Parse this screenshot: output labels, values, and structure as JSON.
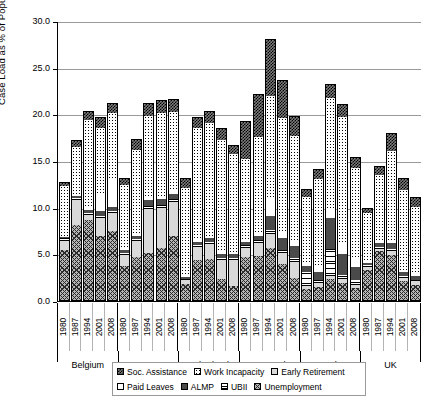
{
  "chart_data": {
    "type": "bar",
    "subtype": "stacked",
    "title": "",
    "xlabel": "",
    "ylabel": "Case Load as % of Population 15-64",
    "ylim": [
      0,
      30
    ],
    "ytick_labels": [
      "0.0",
      "5.0",
      "10.0",
      "15.0",
      "20.0",
      "25.0",
      "30.0"
    ],
    "ytick_values": [
      0,
      5,
      10,
      15,
      20,
      25,
      30
    ],
    "grid": true,
    "legend_position": "bottom",
    "series_names": [
      "Soc. Assistance",
      "Work Incapacity",
      "Early Retirement",
      "Paid Leaves",
      "ALMP",
      "UBII",
      "Unemployment"
    ],
    "groups": [
      "Belgium",
      "Germany",
      "Netherlands",
      "Denmark",
      "Sweden",
      "UK"
    ],
    "categories": [
      "1980",
      "1987",
      "1994",
      "2001",
      "2008"
    ],
    "bars": [
      {
        "group": "Belgium",
        "year": "1980",
        "total": 12.5,
        "segments": {
          "Unemployment": 5.4,
          "Early Retirement": 0.9,
          "UBII": 0.3,
          "ALMP": 0.2,
          "Paid Leaves": 0.1,
          "Work Incapacity": 5.3,
          "Soc. Assistance": 0.3
        }
      },
      {
        "group": "Belgium",
        "year": "1987",
        "total": 17.0,
        "segments": {
          "Unemployment": 8.0,
          "Early Retirement": 2.7,
          "UBII": 0.2,
          "ALMP": 0.3,
          "Paid Leaves": 0.1,
          "Work Incapacity": 5.1,
          "Soc. Assistance": 0.6
        }
      },
      {
        "group": "Belgium",
        "year": "1994",
        "total": 20.2,
        "segments": {
          "Unemployment": 8.6,
          "Early Retirement": 0.5,
          "UBII": 0.2,
          "ALMP": 0.3,
          "Paid Leaves": 0.5,
          "Work Incapacity": 9.2,
          "Soc. Assistance": 0.9
        }
      },
      {
        "group": "Belgium",
        "year": "2001",
        "total": 19.5,
        "segments": {
          "Unemployment": 6.9,
          "Early Retirement": 1.9,
          "UBII": 0.2,
          "ALMP": 0.5,
          "Paid Leaves": 1.9,
          "Work Incapacity": 7.0,
          "Soc. Assistance": 1.1
        }
      },
      {
        "group": "Belgium",
        "year": "2008",
        "total": 21.0,
        "segments": {
          "Unemployment": 7.4,
          "Early Retirement": 1.9,
          "UBII": 0.2,
          "ALMP": 0.5,
          "Paid Leaves": 2.9,
          "Work Incapacity": 7.1,
          "Soc. Assistance": 1.0
        }
      },
      {
        "group": "Germany",
        "year": "1980",
        "total": 13.0,
        "segments": {
          "Unemployment": 3.6,
          "Early Retirement": 1.2,
          "UBII": 0.2,
          "ALMP": 0.4,
          "Paid Leaves": 0.2,
          "Work Incapacity": 6.7,
          "Soc. Assistance": 0.7
        }
      },
      {
        "group": "Germany",
        "year": "1987",
        "total": 17.2,
        "segments": {
          "Unemployment": 4.6,
          "Early Retirement": 1.7,
          "UBII": 0.2,
          "ALMP": 0.4,
          "Paid Leaves": 0.3,
          "Work Incapacity": 8.9,
          "Soc. Assistance": 1.1
        }
      },
      {
        "group": "Germany",
        "year": "1994",
        "total": 21.0,
        "segments": {
          "Unemployment": 5.0,
          "Early Retirement": 4.8,
          "UBII": 0.3,
          "ALMP": 0.6,
          "Paid Leaves": 0.4,
          "Work Incapacity": 8.6,
          "Soc. Assistance": 1.3
        }
      },
      {
        "group": "Germany",
        "year": "2001",
        "total": 21.3,
        "segments": {
          "Unemployment": 5.6,
          "Early Retirement": 4.3,
          "UBII": 0.3,
          "ALMP": 0.6,
          "Paid Leaves": 0.4,
          "Work Incapacity": 8.8,
          "Soc. Assistance": 1.3
        }
      },
      {
        "group": "Germany",
        "year": "2008",
        "total": 21.4,
        "segments": {
          "Unemployment": 6.9,
          "Early Retirement": 3.6,
          "UBII": 0.3,
          "ALMP": 0.6,
          "Paid Leaves": 0.4,
          "Work Incapacity": 8.4,
          "Soc. Assistance": 1.2
        }
      },
      {
        "group": "Netherlands",
        "year": "1980",
        "total": 13.0,
        "segments": {
          "Unemployment": 1.7,
          "Early Retirement": 0.4,
          "UBII": 0.2,
          "ALMP": 0.2,
          "Paid Leaves": 0.1,
          "Work Incapacity": 9.4,
          "Soc. Assistance": 1.0
        }
      },
      {
        "group": "Netherlands",
        "year": "1987",
        "total": 19.5,
        "segments": {
          "Unemployment": 4.3,
          "Early Retirement": 1.4,
          "UBII": 0.2,
          "ALMP": 0.3,
          "Paid Leaves": 0.2,
          "Work Incapacity": 12.0,
          "Soc. Assistance": 1.1
        }
      },
      {
        "group": "Netherlands",
        "year": "1994",
        "total": 20.2,
        "segments": {
          "Unemployment": 4.4,
          "Early Retirement": 1.6,
          "UBII": 0.2,
          "ALMP": 0.4,
          "Paid Leaves": 0.2,
          "Work Incapacity": 12.2,
          "Soc. Assistance": 1.2
        }
      },
      {
        "group": "Netherlands",
        "year": "2001",
        "total": 18.3,
        "segments": {
          "Unemployment": 2.2,
          "Early Retirement": 2.1,
          "UBII": 0.2,
          "ALMP": 0.4,
          "Paid Leaves": 0.2,
          "Work Incapacity": 12.1,
          "Soc. Assistance": 1.1
        }
      },
      {
        "group": "Netherlands",
        "year": "2008",
        "total": 16.5,
        "segments": {
          "Unemployment": 1.5,
          "Early Retirement": 2.8,
          "UBII": 0.2,
          "ALMP": 0.4,
          "Paid Leaves": 0.2,
          "Work Incapacity": 10.5,
          "Soc. Assistance": 0.9
        }
      },
      {
        "group": "Denmark",
        "year": "1980",
        "total": 19.1,
        "segments": {
          "Unemployment": 4.6,
          "Early Retirement": 1.0,
          "UBII": 0.3,
          "ALMP": 0.3,
          "Paid Leaves": 0.3,
          "Work Incapacity": 8.6,
          "Soc. Assistance": 4.0
        }
      },
      {
        "group": "Denmark",
        "year": "1987",
        "total": 22.0,
        "segments": {
          "Unemployment": 4.7,
          "Early Retirement": 1.4,
          "UBII": 0.3,
          "ALMP": 0.5,
          "Paid Leaves": 0.4,
          "Work Incapacity": 10.2,
          "Soc. Assistance": 4.5
        }
      },
      {
        "group": "Denmark",
        "year": "1994",
        "total": 27.9,
        "segments": {
          "Unemployment": 5.6,
          "Early Retirement": 1.5,
          "UBII": 0.4,
          "ALMP": 1.5,
          "Paid Leaves": 1.8,
          "Work Incapacity": 11.1,
          "Soc. Assistance": 6.0
        }
      },
      {
        "group": "Denmark",
        "year": "2001",
        "total": 23.5,
        "segments": {
          "Unemployment": 3.9,
          "Early Retirement": 1.1,
          "UBII": 0.4,
          "ALMP": 1.3,
          "Paid Leaves": 0.5,
          "Work Incapacity": 12.3,
          "Soc. Assistance": 4.0
        }
      },
      {
        "group": "Denmark",
        "year": "2008",
        "total": 19.6,
        "segments": {
          "Unemployment": 2.4,
          "Early Retirement": 1.7,
          "UBII": 0.4,
          "ALMP": 1.3,
          "Paid Leaves": 0.4,
          "Work Incapacity": 11.4,
          "Soc. Assistance": 2.0
        }
      },
      {
        "group": "Sweden",
        "year": "1980",
        "total": 11.8,
        "segments": {
          "Unemployment": 1.2,
          "Early Retirement": 0.3,
          "UBII": 1.5,
          "ALMP": 0.6,
          "Paid Leaves": 0.5,
          "Work Incapacity": 6.9,
          "Soc. Assistance": 0.8
        }
      },
      {
        "group": "Sweden",
        "year": "1987",
        "total": 13.9,
        "segments": {
          "Unemployment": 1.4,
          "Early Retirement": 0.4,
          "UBII": 0.3,
          "ALMP": 0.9,
          "Paid Leaves": 0.8,
          "Work Incapacity": 9.2,
          "Soc. Assistance": 0.9
        }
      },
      {
        "group": "Sweden",
        "year": "1994",
        "total": 23.0,
        "segments": {
          "Unemployment": 2.2,
          "Early Retirement": 0.4,
          "UBII": 2.9,
          "ALMP": 3.3,
          "Paid Leaves": 1.0,
          "Work Incapacity": 11.8,
          "Soc. Assistance": 1.4
        }
      },
      {
        "group": "Sweden",
        "year": "2001",
        "total": 20.9,
        "segments": {
          "Unemployment": 1.8,
          "Early Retirement": 0.4,
          "UBII": 0.5,
          "ALMP": 2.2,
          "Paid Leaves": 1.1,
          "Work Incapacity": 13.6,
          "Soc. Assistance": 1.3
        }
      },
      {
        "group": "Sweden",
        "year": "2008",
        "total": 15.2,
        "segments": {
          "Unemployment": 1.3,
          "Early Retirement": 0.3,
          "UBII": 0.5,
          "ALMP": 1.4,
          "Paid Leaves": 1.0,
          "Work Incapacity": 9.7,
          "Soc. Assistance": 1.0
        }
      },
      {
        "group": "UK",
        "year": "1980",
        "total": 9.8,
        "segments": {
          "Unemployment": 3.2,
          "Early Retirement": 0.3,
          "UBII": 0.2,
          "ALMP": 0.3,
          "Paid Leaves": 0.1,
          "Work Incapacity": 5.2,
          "Soc. Assistance": 0.5
        }
      },
      {
        "group": "UK",
        "year": "1987",
        "total": 14.3,
        "segments": {
          "Unemployment": 5.2,
          "Early Retirement": 0.3,
          "UBII": 0.2,
          "ALMP": 0.4,
          "Paid Leaves": 0.2,
          "Work Incapacity": 7.1,
          "Soc. Assistance": 0.9
        }
      },
      {
        "group": "UK",
        "year": "1994",
        "total": 17.8,
        "segments": {
          "Unemployment": 4.8,
          "Early Retirement": 0.4,
          "UBII": 0.3,
          "ALMP": 0.6,
          "Paid Leaves": 0.2,
          "Work Incapacity": 9.7,
          "Soc. Assistance": 1.8
        }
      },
      {
        "group": "UK",
        "year": "2001",
        "total": 13.0,
        "segments": {
          "Unemployment": 2.0,
          "Early Retirement": 0.4,
          "UBII": 0.2,
          "ALMP": 0.4,
          "Paid Leaves": 0.2,
          "Work Incapacity": 8.6,
          "Soc. Assistance": 1.2
        }
      },
      {
        "group": "UK",
        "year": "2008",
        "total": 10.9,
        "segments": {
          "Unemployment": 1.6,
          "Early Retirement": 0.4,
          "UBII": 0.2,
          "ALMP": 0.4,
          "Paid Leaves": 0.2,
          "Work Incapacity": 7.2,
          "Soc. Assistance": 0.9
        }
      }
    ]
  },
  "axis": {
    "y_title": "Case Load as % of Population 15-64",
    "y_ticks": [
      "30.0",
      "25.0",
      "20.0",
      "15.0",
      "10.0",
      "5.0",
      "0.0"
    ]
  },
  "legend": {
    "row1": [
      {
        "label": "Soc. Assistance",
        "pattern": "p-soc"
      },
      {
        "label": "Work Incapacity",
        "pattern": "p-work"
      },
      {
        "label": "Early Retirement",
        "pattern": "p-early"
      }
    ],
    "row2": [
      {
        "label": "Paid Leaves",
        "pattern": "p-paid"
      },
      {
        "label": "ALMP",
        "pattern": "p-almp"
      },
      {
        "label": "UBII",
        "pattern": "p-ubii"
      },
      {
        "label": "Unemployment",
        "pattern": "p-unemp"
      }
    ]
  }
}
